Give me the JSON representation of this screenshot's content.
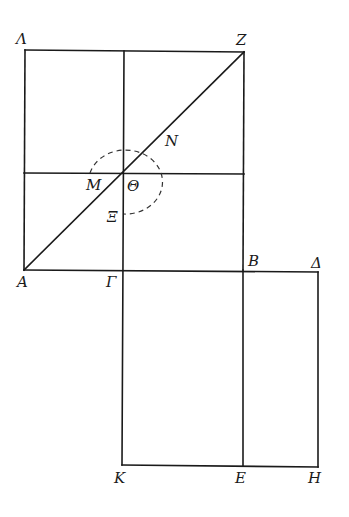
{
  "diagram": {
    "type": "geometric-construction",
    "labels": {
      "Lambda": "Λ",
      "Z": "Z",
      "N": "N",
      "M": "M",
      "Theta": "Θ",
      "Xi": "Ξ",
      "A": "A",
      "Gamma": "Γ",
      "B": "B",
      "Delta": "Δ",
      "K": "K",
      "E": "E",
      "H": "H"
    },
    "points": {
      "Lambda": [
        25,
        50
      ],
      "Z": [
        244,
        52
      ],
      "A": [
        24,
        270
      ],
      "Gamma": [
        123,
        270
      ],
      "B": [
        243,
        270
      ],
      "Delta": [
        318,
        272
      ],
      "K": [
        122,
        465
      ],
      "E": [
        243,
        466
      ],
      "H": [
        318,
        467
      ],
      "Theta": [
        123,
        173
      ]
    },
    "segments": [
      [
        "Lambda",
        "Z"
      ],
      [
        "Lambda",
        "A"
      ],
      [
        "Z",
        "B"
      ],
      [
        "A",
        "Delta"
      ],
      [
        "A",
        "Z"
      ],
      [
        "Delta",
        "H"
      ],
      [
        "K",
        "H"
      ],
      [
        "B",
        "E"
      ]
    ],
    "colors": {
      "ink": "#1a1a1a",
      "background": "#ffffff"
    }
  }
}
